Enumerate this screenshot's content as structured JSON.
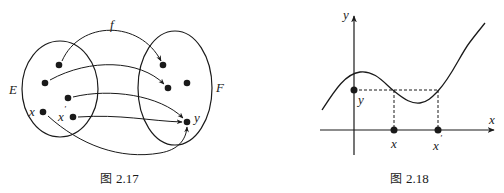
{
  "figures": [
    {
      "id": "fig-2-17",
      "caption_prefix": "图",
      "caption_number": "2.17",
      "map_label": "f",
      "set_domain_label": "E",
      "set_codomain_label": "F",
      "point_labels": {
        "x": "x",
        "x_prime": "x",
        "x_prime_mark": "′",
        "y": "y"
      },
      "description": "Arrow diagram of a function f from set E to set F; two distinct elements x and x′ map to the same y (not injective)."
    },
    {
      "id": "fig-2-18",
      "caption_prefix": "图",
      "caption_number": "2.18",
      "axis_labels": {
        "x": "x",
        "y": "y"
      },
      "point_labels": {
        "y": "y",
        "x": "x",
        "x_prime": "x",
        "x_prime_mark": "′"
      },
      "description": "Graph of a non-injective function: horizontal dashed line at height y meets the curve at two abscissas x and x′."
    }
  ],
  "colors": {
    "ink": "#1a1a1a",
    "background": "#ffffff"
  }
}
